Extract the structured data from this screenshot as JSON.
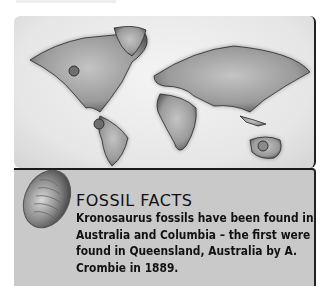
{
  "map": {
    "markers": [
      {
        "name": "north-america-marker",
        "x": 60,
        "y": 55
      },
      {
        "name": "south-america-marker",
        "x": 85,
        "y": 108
      },
      {
        "name": "australia-marker",
        "x": 249,
        "y": 130
      }
    ]
  },
  "fact": {
    "title": "FOSSIL FACTS",
    "body": "Kronosaurus fossils have been found in Australia and Columbia – the first were found in Queensland, Australia by A. Crombie in 1889."
  },
  "colors": {
    "panel_bg": "#c9c9c9",
    "border": "#222222",
    "text": "#111111"
  }
}
